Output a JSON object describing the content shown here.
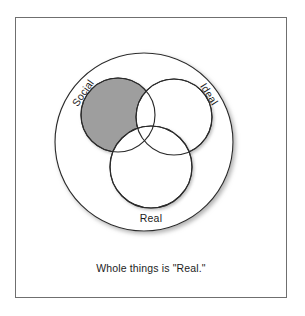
{
  "figure": {
    "title_caption": "Whole things is \"Real.\"",
    "frame": {
      "border_color": "#6f6f6f",
      "background_color": "#ffffff"
    },
    "diagram_type": "venn",
    "colors": {
      "stroke": "#2b2b2b",
      "fill_empty": "#ffffff",
      "fill_highlight": "#9e9e9e",
      "text": "#1d1d1d",
      "shadow": "#b4b4b4"
    },
    "universe": {
      "label": "",
      "cx": 144,
      "cy": 142,
      "r": 89,
      "shaded": false
    },
    "sets": [
      {
        "label": "Social",
        "cx": 118,
        "cy": 115,
        "r": 37,
        "shaded": true,
        "label_rotation": -55,
        "label_x": 86,
        "label_y": 95
      },
      {
        "label": "Ideal",
        "cx": 174,
        "cy": 117,
        "r": 38,
        "shaded": false,
        "label_rotation": 58,
        "label_x": 206,
        "label_y": 96
      },
      {
        "label": "Real",
        "cx": 151,
        "cy": 167,
        "r": 41,
        "shaded": false,
        "label_rotation": 0,
        "label_x": 151,
        "label_y": 222
      }
    ]
  }
}
